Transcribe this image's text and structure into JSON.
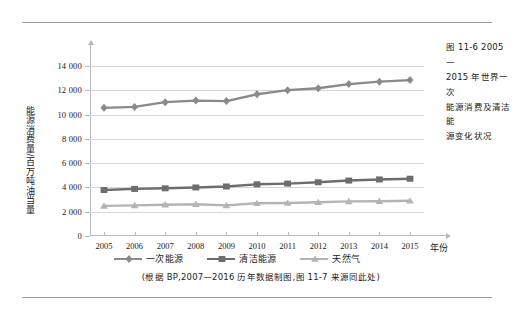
{
  "caption": {
    "lines": [
      "图 11-6  2005—",
      "2015 年世界一次",
      "能源消费及清洁能",
      "源变化状况"
    ],
    "full": "图 11-6 2005—2015 年世界一次能源消费及清洁能源变化状况"
  },
  "source_note": "(根据 BP,2007—2016 历年数据制图,图 11-7 来源同此处)",
  "chart_data": {
    "type": "line",
    "title": "",
    "xlabel": "年份",
    "ylabel": "能源消费量/百万吨油当量",
    "categories": [
      "2005",
      "2006",
      "2007",
      "2008",
      "2009",
      "2010",
      "2011",
      "2012",
      "2013",
      "2014",
      "2015"
    ],
    "ylim": [
      0,
      15000
    ],
    "yticks": [
      0,
      2000,
      4000,
      6000,
      8000,
      10000,
      12000,
      14000
    ],
    "ytick_labels": [
      "0",
      "2 000",
      "4 000",
      "6 000",
      "8 000",
      "10 000",
      "12 000",
      "14 000"
    ],
    "grid": true,
    "legend_position": "bottom",
    "series": [
      {
        "name": "一次能源",
        "color": "#8a8a8a",
        "marker": "diamond",
        "values": [
          10560,
          10640,
          11030,
          11160,
          11120,
          11680,
          12020,
          12180,
          12520,
          12720,
          12850
        ]
      },
      {
        "name": "清洁能源",
        "color": "#6d6d6d",
        "marker": "square",
        "values": [
          3790,
          3880,
          3930,
          4000,
          4080,
          4260,
          4320,
          4430,
          4570,
          4660,
          4720
        ]
      },
      {
        "name": "天然气",
        "color": "#b4b4b4",
        "marker": "triangle",
        "values": [
          2480,
          2520,
          2580,
          2620,
          2520,
          2700,
          2720,
          2780,
          2850,
          2870,
          2900
        ]
      }
    ]
  }
}
